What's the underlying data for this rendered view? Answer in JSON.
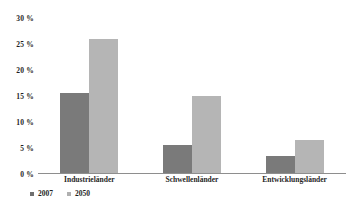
{
  "chart_data": {
    "type": "bar",
    "title": "",
    "xlabel": "",
    "ylabel": "",
    "categories": [
      "Industrieländer",
      "Schwellenländer",
      "Entwicklungsländer"
    ],
    "series": [
      {
        "name": "2007",
        "color": "#7a7a7a",
        "values": [
          15.5,
          5.5,
          3.5
        ]
      },
      {
        "name": "2050",
        "color": "#b5b5b5",
        "values": [
          26.0,
          15.0,
          6.5
        ]
      }
    ],
    "ylim": [
      0,
      30
    ],
    "ytick_values": [
      30,
      25,
      20,
      15,
      10,
      5,
      0
    ],
    "ytick_labels": [
      "30 %",
      "25 %",
      "20 %",
      "15 %",
      "10 %",
      "5 %",
      "0 %"
    ],
    "grid": false,
    "legend_position": "bottom-left",
    "legend_entries": [
      "2007",
      "2050"
    ],
    "annotations": []
  },
  "caption": {
    "text": "Population Reference (2007): Der Anteau...",
    "visible": false
  },
  "colors": {
    "series_2007": "#7a7a7a",
    "series_2050": "#b5b5b5",
    "axis": "#8e8e8e",
    "text": "#1f1f1f",
    "background": "#ffffff"
  }
}
